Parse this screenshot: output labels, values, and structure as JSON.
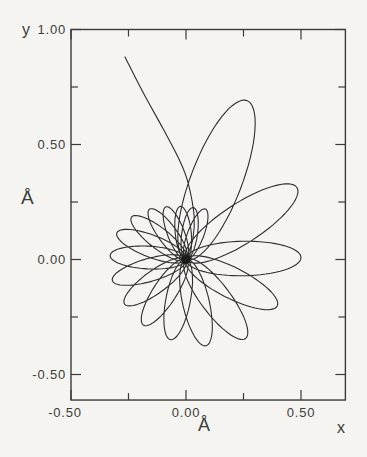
{
  "figure": {
    "y_axis_label": "y",
    "x_axis_label": "x",
    "y_unit": "Å",
    "x_unit": "Å"
  },
  "chart_data": {
    "type": "line",
    "title": "",
    "xlabel": "x",
    "ylabel": "y",
    "axis_unit": "Å",
    "xlim": [
      -0.5,
      0.693
    ],
    "ylim": [
      -0.611,
      1.0
    ],
    "grid": false,
    "legend": "none",
    "x_ticks": {
      "major": [
        -0.5,
        0.0,
        0.5
      ],
      "minor": [
        -0.25,
        0.25
      ],
      "labels": [
        "-0.50",
        "0.00",
        "0.50"
      ]
    },
    "y_ticks": {
      "major": [
        1.0,
        0.5,
        0.0,
        -0.5
      ],
      "minor": [
        0.75,
        0.25,
        -0.25
      ],
      "labels": [
        "1.00",
        "0.50",
        "0.00",
        "-0.50"
      ]
    },
    "line_color": "#2d2d2d",
    "ink_color": "#3a3a3a",
    "background": "#f5f4f0",
    "series": [
      {
        "name": "trajectory",
        "description": "x-y trajectory (in Angstrom) starting near (-0.27, 0.88), falling into a precessing rosette of elliptical loops centred on the origin; petal amplitude decays from 0.74 A to about 0.23 A while the apsidal direction precesses clockwise from 69 deg through a full turn",
        "entry_path": [
          [
            -0.265,
            0.881
          ],
          [
            -0.187,
            0.727
          ],
          [
            -0.1,
            0.569
          ],
          [
            -0.026,
            0.427
          ],
          [
            0.01,
            0.33
          ],
          [
            0.035,
            0.19
          ],
          [
            0.03,
            0.09
          ],
          [
            0.005,
            0.015
          ]
        ],
        "rosette_center": [
          0.0,
          0.0
        ],
        "petal_width_ratio": 0.3,
        "petals": [
          {
            "angle_deg": 69,
            "r": 0.74
          },
          {
            "angle_deg": 33,
            "r": 0.575
          },
          {
            "angle_deg": 1,
            "r": 0.5
          },
          {
            "angle_deg": -27,
            "r": 0.445
          },
          {
            "angle_deg": -53,
            "r": 0.43
          },
          {
            "angle_deg": -77,
            "r": 0.385
          },
          {
            "angle_deg": -101,
            "r": 0.355
          },
          {
            "angle_deg": -123,
            "r": 0.34
          },
          {
            "angle_deg": -144,
            "r": 0.33
          },
          {
            "angle_deg": -164,
            "r": 0.333
          },
          {
            "angle_deg": -183,
            "r": 0.33
          },
          {
            "angle_deg": -201,
            "r": 0.322
          },
          {
            "angle_deg": -218,
            "r": 0.3
          },
          {
            "angle_deg": -234,
            "r": 0.27
          },
          {
            "angle_deg": -249,
            "r": 0.245
          },
          {
            "angle_deg": -264,
            "r": 0.232
          },
          {
            "angle_deg": -278,
            "r": 0.228
          },
          {
            "angle_deg": -291,
            "r": 0.235
          }
        ]
      }
    ]
  }
}
